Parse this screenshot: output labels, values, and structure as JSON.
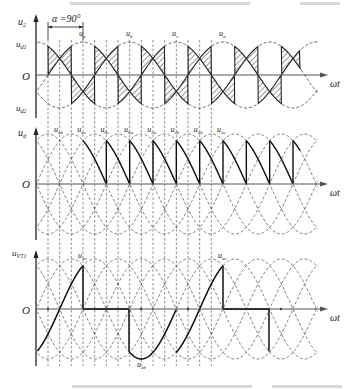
{
  "chart_data": {
    "type": "line",
    "alpha_deg": 90,
    "alpha_label": "α =90°",
    "x_label": "ωt",
    "origin_label": "O",
    "phase_labels": [
      "ua",
      "ub",
      "uc",
      "ua"
    ],
    "panels": [
      {
        "id": "u2",
        "ylabel_main": "u",
        "ylabel_sub": "2",
        "levels": [
          {
            "main": "u",
            "sub": "d1"
          },
          {
            "main": "u",
            "sub": "d2"
          }
        ],
        "series": [
          "ua",
          "ub",
          "uc"
        ],
        "description": "Phase voltages (dashed); hatched regions show conducting portions of positive (ud1) and negative (ud2) groups"
      },
      {
        "id": "ud",
        "ylabel_main": "u",
        "ylabel_sub": "d",
        "series": [
          "uab",
          "uac",
          "ubc",
          "uba",
          "uca",
          "ucb"
        ],
        "segment_labels": [
          {
            "main": "u",
            "sub": "ab"
          },
          {
            "main": "u",
            "sub": "ac"
          },
          {
            "main": "u",
            "sub": "bc"
          },
          {
            "main": "u",
            "sub": "ba"
          },
          {
            "main": "u",
            "sub": "ca"
          },
          {
            "main": "u",
            "sub": "cb"
          },
          {
            "main": "u",
            "sub": "ab"
          },
          {
            "main": "u",
            "sub": "ac"
          }
        ],
        "description": "Output voltage: line-voltage segments from 60° to 0 (sawtooth), discontinuous at α=90°"
      },
      {
        "id": "uVT1",
        "ylabel_main": "u",
        "ylabel_sub": "VT1",
        "annotations": [
          {
            "main": "u",
            "sub": "ac"
          },
          {
            "main": "u",
            "sub": "ab"
          }
        ],
        "description": "Voltage across thyristor VT1"
      }
    ],
    "commutation_interval_deg": 60,
    "periods_shown": 2
  }
}
